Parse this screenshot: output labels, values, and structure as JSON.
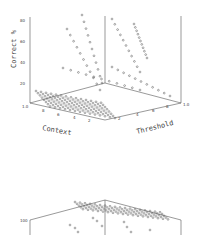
{
  "chart_data": [
    {
      "type": "scatter3d",
      "title": "",
      "xlabel": "Context",
      "ylabel": "Threshold",
      "zlabel": "Correct %",
      "x_ticks": [
        "1.0",
        "8",
        "6",
        "4",
        "2"
      ],
      "y_ticks": [
        "2",
        "4",
        "6",
        "8",
        "1.0"
      ],
      "z_ticks": [
        "20",
        "40",
        "60",
        "80"
      ],
      "zlim": [
        0,
        85
      ],
      "grid": false,
      "description": "Dense floor of points near 0-15% at low thresholds; diagonal rows of points rising toward ~80% as context and threshold vary"
    },
    {
      "type": "scatter3d",
      "title": "",
      "z_ticks": [
        "100"
      ],
      "description": "Partially visible second 3D plot; dense surface of points near 100% with scattered points below"
    }
  ],
  "plot1": {
    "xlabel": "Context",
    "ylabel": "Threshold",
    "zlabel": "Correct %",
    "x_ticks": [
      "1.0",
      "8",
      "6",
      "4",
      "2"
    ],
    "y_ticks": [
      "2",
      "4",
      "6",
      "8",
      "1.0"
    ],
    "z_ticks": [
      "20",
      "40",
      "60",
      "80"
    ]
  },
  "plot2": {
    "z_tick": "100"
  }
}
